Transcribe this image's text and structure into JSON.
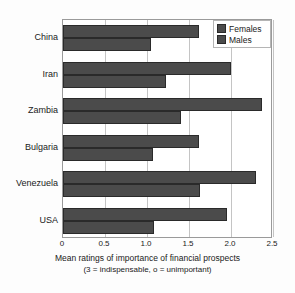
{
  "chart_data": {
    "type": "bar",
    "orientation": "horizontal",
    "title": "",
    "xlabel": "Mean ratings of importance of financial prospects",
    "xlabel_line2": "(3 = indispensable, o = unimportant)",
    "ylabel": "",
    "categories": [
      "China",
      "Iran",
      "Zambia",
      "Bulgaria",
      "Venezuela",
      "USA"
    ],
    "series": [
      {
        "name": "Females",
        "values": [
          1.62,
          2.0,
          2.37,
          1.62,
          2.3,
          1.95
        ]
      },
      {
        "name": "Males",
        "values": [
          1.05,
          1.23,
          1.4,
          1.07,
          1.63,
          1.08
        ]
      }
    ],
    "xlim": [
      0,
      2.5
    ],
    "xticks": [
      0,
      0.5,
      1.0,
      1.5,
      2.0,
      2.5
    ],
    "xtick_labels": [
      "0",
      "0.5",
      "1.0",
      "1.5",
      "2.0",
      "2.5"
    ],
    "grid": true,
    "grid_axis": "x",
    "legend_position": "top-right",
    "bar_color": "#4b4b4b",
    "bar_edge_color": "#2a2a2a",
    "grid_color": "#c4c4c4",
    "frame_color": "#9a9a9a"
  },
  "legend": {
    "entries": [
      {
        "label": "Females"
      },
      {
        "label": "Males"
      }
    ]
  }
}
